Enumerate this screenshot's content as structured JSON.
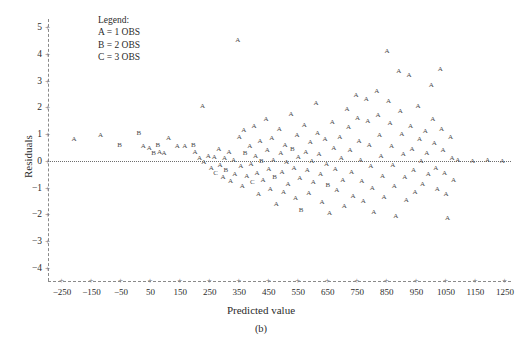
{
  "figure": {
    "caption": "(b)",
    "background": "#ffffff",
    "glyph_color": "#4a4a4a",
    "axis_color": "#8a8a8a"
  },
  "legend": {
    "title": "Legend:",
    "entries": [
      "A = 1 OBS",
      "B = 2 OBS",
      "C = 3 OBS"
    ]
  },
  "chart_data": {
    "type": "scatter",
    "title": "",
    "subtitle": "",
    "xlabel": "Predicted value",
    "ylabel": "Residuals",
    "xlim": [
      -300,
      1300
    ],
    "ylim": [
      -4,
      5
    ],
    "grid": false,
    "legend_position": "top-left",
    "reference_line": {
      "y": 0,
      "style": "dotted"
    },
    "xticks": [
      -250,
      -150,
      -50,
      50,
      150,
      250,
      350,
      450,
      550,
      650,
      750,
      850,
      950,
      1050,
      1150,
      1250
    ],
    "yticks": [
      5,
      4,
      3,
      2,
      1,
      0,
      -1,
      -2,
      -3,
      -4
    ],
    "marker_encoding": {
      "A": 1,
      "B": 2,
      "C": 3
    },
    "annotations": [],
    "points": [
      {
        "x": -210,
        "y": 0.8,
        "m": "A"
      },
      {
        "x": -120,
        "y": 0.95,
        "m": "A"
      },
      {
        "x": -55,
        "y": 0.6,
        "m": "B"
      },
      {
        "x": 10,
        "y": 1.05,
        "m": "B"
      },
      {
        "x": 25,
        "y": 0.55,
        "m": "A"
      },
      {
        "x": 45,
        "y": 0.5,
        "m": "A"
      },
      {
        "x": 60,
        "y": 0.3,
        "m": "B"
      },
      {
        "x": 75,
        "y": 0.6,
        "m": "B"
      },
      {
        "x": 80,
        "y": 0.35,
        "m": "A"
      },
      {
        "x": 95,
        "y": 0.3,
        "m": "A"
      },
      {
        "x": 110,
        "y": 0.85,
        "m": "A"
      },
      {
        "x": 140,
        "y": 0.55,
        "m": "A"
      },
      {
        "x": 165,
        "y": 0.55,
        "m": "A"
      },
      {
        "x": 195,
        "y": 0.6,
        "m": "B"
      },
      {
        "x": 200,
        "y": 0.35,
        "m": "A"
      },
      {
        "x": 215,
        "y": 0.1,
        "m": "A"
      },
      {
        "x": 225,
        "y": 2.05,
        "m": "A"
      },
      {
        "x": 230,
        "y": -0.05,
        "m": "A"
      },
      {
        "x": 245,
        "y": 0.2,
        "m": "A"
      },
      {
        "x": 255,
        "y": -0.25,
        "m": "A"
      },
      {
        "x": 265,
        "y": 0.15,
        "m": "A"
      },
      {
        "x": 270,
        "y": -0.45,
        "m": "C"
      },
      {
        "x": 280,
        "y": 0.45,
        "m": "A"
      },
      {
        "x": 285,
        "y": -0.15,
        "m": "A"
      },
      {
        "x": 295,
        "y": -0.6,
        "m": "A"
      },
      {
        "x": 300,
        "y": 0.1,
        "m": "A"
      },
      {
        "x": 305,
        "y": -0.35,
        "m": "B"
      },
      {
        "x": 315,
        "y": 0.35,
        "m": "A"
      },
      {
        "x": 320,
        "y": -0.75,
        "m": "A"
      },
      {
        "x": 330,
        "y": 0.05,
        "m": "A"
      },
      {
        "x": 335,
        "y": -0.5,
        "m": "A"
      },
      {
        "x": 345,
        "y": 4.5,
        "m": "A"
      },
      {
        "x": 350,
        "y": 0.9,
        "m": "A"
      },
      {
        "x": 355,
        "y": -0.2,
        "m": "A"
      },
      {
        "x": 360,
        "y": -0.95,
        "m": "A"
      },
      {
        "x": 365,
        "y": 1.15,
        "m": "A"
      },
      {
        "x": 370,
        "y": 0.3,
        "m": "B"
      },
      {
        "x": 375,
        "y": -0.55,
        "m": "A"
      },
      {
        "x": 385,
        "y": 0.55,
        "m": "A"
      },
      {
        "x": 390,
        "y": -0.1,
        "m": "A"
      },
      {
        "x": 395,
        "y": -0.8,
        "m": "C"
      },
      {
        "x": 400,
        "y": 1.3,
        "m": "A"
      },
      {
        "x": 405,
        "y": 0.2,
        "m": "A"
      },
      {
        "x": 410,
        "y": -0.45,
        "m": "A"
      },
      {
        "x": 415,
        "y": -1.25,
        "m": "A"
      },
      {
        "x": 420,
        "y": 0.75,
        "m": "A"
      },
      {
        "x": 425,
        "y": 0.0,
        "m": "B"
      },
      {
        "x": 430,
        "y": -0.7,
        "m": "A"
      },
      {
        "x": 440,
        "y": 1.55,
        "m": "A"
      },
      {
        "x": 445,
        "y": 0.4,
        "m": "A"
      },
      {
        "x": 450,
        "y": -0.3,
        "m": "A"
      },
      {
        "x": 455,
        "y": -1.05,
        "m": "A"
      },
      {
        "x": 460,
        "y": 0.85,
        "m": "A"
      },
      {
        "x": 465,
        "y": 0.05,
        "m": "A"
      },
      {
        "x": 470,
        "y": -0.6,
        "m": "B"
      },
      {
        "x": 475,
        "y": -1.6,
        "m": "A"
      },
      {
        "x": 485,
        "y": 1.2,
        "m": "A"
      },
      {
        "x": 490,
        "y": 0.3,
        "m": "A"
      },
      {
        "x": 495,
        "y": -0.4,
        "m": "A"
      },
      {
        "x": 500,
        "y": -1.15,
        "m": "A"
      },
      {
        "x": 505,
        "y": 0.6,
        "m": "A"
      },
      {
        "x": 510,
        "y": -0.05,
        "m": "A"
      },
      {
        "x": 515,
        "y": -0.85,
        "m": "A"
      },
      {
        "x": 525,
        "y": 1.75,
        "m": "A"
      },
      {
        "x": 530,
        "y": 0.45,
        "m": "B"
      },
      {
        "x": 535,
        "y": -0.25,
        "m": "A"
      },
      {
        "x": 540,
        "y": -1.4,
        "m": "A"
      },
      {
        "x": 545,
        "y": 0.95,
        "m": "A"
      },
      {
        "x": 550,
        "y": 0.15,
        "m": "A"
      },
      {
        "x": 555,
        "y": -0.65,
        "m": "A"
      },
      {
        "x": 560,
        "y": -1.85,
        "m": "B"
      },
      {
        "x": 570,
        "y": 1.35,
        "m": "A"
      },
      {
        "x": 575,
        "y": 0.35,
        "m": "A"
      },
      {
        "x": 580,
        "y": -0.35,
        "m": "A"
      },
      {
        "x": 585,
        "y": -1.2,
        "m": "A"
      },
      {
        "x": 590,
        "y": 0.7,
        "m": "A"
      },
      {
        "x": 595,
        "y": 0.0,
        "m": "A"
      },
      {
        "x": 600,
        "y": -0.8,
        "m": "A"
      },
      {
        "x": 610,
        "y": 2.15,
        "m": "A"
      },
      {
        "x": 615,
        "y": 1.05,
        "m": "A"
      },
      {
        "x": 620,
        "y": 0.25,
        "m": "A"
      },
      {
        "x": 625,
        "y": -0.5,
        "m": "A"
      },
      {
        "x": 630,
        "y": -1.55,
        "m": "A"
      },
      {
        "x": 640,
        "y": 0.8,
        "m": "A"
      },
      {
        "x": 645,
        "y": -0.1,
        "m": "A"
      },
      {
        "x": 650,
        "y": -0.9,
        "m": "B"
      },
      {
        "x": 655,
        "y": -1.95,
        "m": "A"
      },
      {
        "x": 665,
        "y": 1.45,
        "m": "A"
      },
      {
        "x": 670,
        "y": 0.5,
        "m": "A"
      },
      {
        "x": 675,
        "y": -0.3,
        "m": "A"
      },
      {
        "x": 680,
        "y": -1.1,
        "m": "A"
      },
      {
        "x": 690,
        "y": 0.9,
        "m": "A"
      },
      {
        "x": 695,
        "y": 0.1,
        "m": "A"
      },
      {
        "x": 700,
        "y": -0.7,
        "m": "A"
      },
      {
        "x": 705,
        "y": -1.7,
        "m": "A"
      },
      {
        "x": 715,
        "y": 1.95,
        "m": "A"
      },
      {
        "x": 720,
        "y": 1.25,
        "m": "A"
      },
      {
        "x": 725,
        "y": 0.4,
        "m": "A"
      },
      {
        "x": 730,
        "y": -0.4,
        "m": "A"
      },
      {
        "x": 735,
        "y": -1.3,
        "m": "A"
      },
      {
        "x": 745,
        "y": 2.45,
        "m": "A"
      },
      {
        "x": 750,
        "y": 1.6,
        "m": "A"
      },
      {
        "x": 755,
        "y": 0.75,
        "m": "A"
      },
      {
        "x": 760,
        "y": 0.05,
        "m": "A"
      },
      {
        "x": 765,
        "y": -0.75,
        "m": "A"
      },
      {
        "x": 770,
        "y": -1.5,
        "m": "A"
      },
      {
        "x": 780,
        "y": 2.3,
        "m": "A"
      },
      {
        "x": 785,
        "y": 1.5,
        "m": "A"
      },
      {
        "x": 790,
        "y": 0.6,
        "m": "A"
      },
      {
        "x": 795,
        "y": -0.2,
        "m": "A"
      },
      {
        "x": 800,
        "y": -1.0,
        "m": "A"
      },
      {
        "x": 805,
        "y": -1.9,
        "m": "A"
      },
      {
        "x": 815,
        "y": 2.6,
        "m": "A"
      },
      {
        "x": 820,
        "y": 1.7,
        "m": "A"
      },
      {
        "x": 825,
        "y": 0.95,
        "m": "A"
      },
      {
        "x": 830,
        "y": 0.2,
        "m": "A"
      },
      {
        "x": 835,
        "y": -0.55,
        "m": "A"
      },
      {
        "x": 840,
        "y": -1.35,
        "m": "A"
      },
      {
        "x": 850,
        "y": 4.1,
        "m": "A"
      },
      {
        "x": 855,
        "y": 2.25,
        "m": "A"
      },
      {
        "x": 860,
        "y": 1.4,
        "m": "A"
      },
      {
        "x": 865,
        "y": 0.55,
        "m": "A"
      },
      {
        "x": 870,
        "y": -0.15,
        "m": "A"
      },
      {
        "x": 875,
        "y": -0.95,
        "m": "A"
      },
      {
        "x": 880,
        "y": -2.05,
        "m": "A"
      },
      {
        "x": 890,
        "y": 3.35,
        "m": "A"
      },
      {
        "x": 895,
        "y": 1.85,
        "m": "A"
      },
      {
        "x": 900,
        "y": 1.0,
        "m": "A"
      },
      {
        "x": 905,
        "y": 0.25,
        "m": "A"
      },
      {
        "x": 910,
        "y": -0.6,
        "m": "A"
      },
      {
        "x": 915,
        "y": -1.45,
        "m": "A"
      },
      {
        "x": 925,
        "y": 3.2,
        "m": "A"
      },
      {
        "x": 930,
        "y": 1.3,
        "m": "A"
      },
      {
        "x": 935,
        "y": 0.45,
        "m": "A"
      },
      {
        "x": 940,
        "y": -0.35,
        "m": "A"
      },
      {
        "x": 945,
        "y": -1.15,
        "m": "A"
      },
      {
        "x": 955,
        "y": 2.05,
        "m": "A"
      },
      {
        "x": 960,
        "y": 0.8,
        "m": "A"
      },
      {
        "x": 965,
        "y": 0.0,
        "m": "A"
      },
      {
        "x": 970,
        "y": -0.85,
        "m": "A"
      },
      {
        "x": 980,
        "y": 1.1,
        "m": "A"
      },
      {
        "x": 985,
        "y": 0.3,
        "m": "A"
      },
      {
        "x": 990,
        "y": -0.5,
        "m": "A"
      },
      {
        "x": 1000,
        "y": 2.85,
        "m": "A"
      },
      {
        "x": 1005,
        "y": 1.55,
        "m": "A"
      },
      {
        "x": 1010,
        "y": 0.65,
        "m": "A"
      },
      {
        "x": 1015,
        "y": -0.25,
        "m": "A"
      },
      {
        "x": 1020,
        "y": -1.05,
        "m": "A"
      },
      {
        "x": 1030,
        "y": 3.45,
        "m": "A"
      },
      {
        "x": 1035,
        "y": 1.2,
        "m": "A"
      },
      {
        "x": 1040,
        "y": 0.4,
        "m": "A"
      },
      {
        "x": 1045,
        "y": -0.45,
        "m": "A"
      },
      {
        "x": 1050,
        "y": -1.25,
        "m": "A"
      },
      {
        "x": 1055,
        "y": -2.15,
        "m": "A"
      },
      {
        "x": 1065,
        "y": 0.9,
        "m": "A"
      },
      {
        "x": 1070,
        "y": 0.1,
        "m": "A"
      },
      {
        "x": 1075,
        "y": -0.7,
        "m": "A"
      },
      {
        "x": 1090,
        "y": 0.05,
        "m": "A"
      },
      {
        "x": 1140,
        "y": 0.0,
        "m": "A"
      },
      {
        "x": 1190,
        "y": 0.05,
        "m": "A"
      },
      {
        "x": 1240,
        "y": 0.0,
        "m": "A"
      }
    ]
  }
}
